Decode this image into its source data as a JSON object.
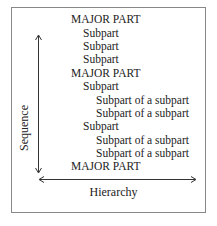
{
  "diagram": {
    "axes": {
      "vertical_label": "Sequence",
      "horizontal_label": "Hierarchy"
    },
    "lines": [
      {
        "text": "MAJOR PART",
        "level": 0
      },
      {
        "text": "Subpart",
        "level": 1
      },
      {
        "text": "Subpart",
        "level": 1
      },
      {
        "text": "Subpart",
        "level": 1
      },
      {
        "text": "MAJOR PART",
        "level": 0
      },
      {
        "text": "Subpart",
        "level": 1
      },
      {
        "text": "Subpart of a subpart",
        "level": 2
      },
      {
        "text": "Subpart of a subpart",
        "level": 2
      },
      {
        "text": "Subpart",
        "level": 1
      },
      {
        "text": "Subpart of a subpart",
        "level": 2
      },
      {
        "text": "Subpart of a subpart",
        "level": 2
      },
      {
        "text": "MAJOR PART",
        "level": 0
      }
    ]
  }
}
